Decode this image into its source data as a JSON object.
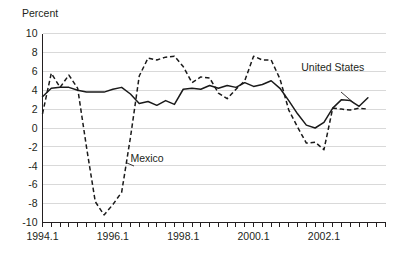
{
  "chart_data": {
    "type": "line",
    "title": "",
    "ylabel": "Percent",
    "xlabel": "",
    "ylim": [
      -10,
      10
    ],
    "ytick_labels": [
      "10",
      "8",
      "6",
      "4",
      "2",
      "0",
      "-2",
      "-4",
      "-6",
      "-8",
      "-10"
    ],
    "ytick_values": [
      10,
      8,
      6,
      4,
      2,
      0,
      -2,
      -4,
      -6,
      -8,
      -10
    ],
    "xtick_labels": [
      "1994.1",
      "1996.1",
      "1998.1",
      "2000.1",
      "2002.1"
    ],
    "xtick_values": [
      1994.1,
      1996.1,
      1998.1,
      2000.1,
      2002.1
    ],
    "xlim": [
      1994.1,
      2003.4
    ],
    "grid": true,
    "legend_position": "inline-annotations",
    "annotations": [
      {
        "text": "United States",
        "x": 2001.6,
        "y": 6.0
      },
      {
        "text": "Mexico",
        "x": 1996.3,
        "y": -3.6
      }
    ],
    "x": [
      1994.1,
      1994.2,
      1994.3,
      1994.4,
      1995.1,
      1995.2,
      1995.3,
      1995.4,
      1996.1,
      1996.2,
      1996.3,
      1996.4,
      1997.1,
      1997.2,
      1997.3,
      1997.4,
      1998.1,
      1998.2,
      1998.3,
      1998.4,
      1999.1,
      1999.2,
      1999.3,
      1999.4,
      2000.1,
      2000.2,
      2000.3,
      2000.4,
      2001.1,
      2001.2,
      2001.3,
      2001.4,
      2002.1,
      2002.2,
      2002.3,
      2002.4,
      2003.1,
      2003.2
    ],
    "series": [
      {
        "name": "United States",
        "style": "solid",
        "values": [
          3.3,
          4.2,
          4.3,
          4.3,
          4.0,
          3.8,
          3.8,
          3.8,
          4.1,
          4.3,
          3.6,
          2.6,
          2.8,
          2.4,
          2.9,
          2.5,
          4.1,
          4.2,
          4.1,
          4.5,
          4.2,
          4.5,
          4.3,
          4.8,
          4.4,
          4.6,
          5.0,
          4.2,
          2.9,
          1.5,
          0.3,
          0.0,
          0.6,
          2.1,
          3.0,
          2.9,
          2.3,
          3.2
        ]
      },
      {
        "name": "Mexico",
        "style": "dashed",
        "values": [
          1.5,
          5.8,
          4.3,
          5.6,
          4.2,
          -2.0,
          -7.8,
          -9.2,
          -8.1,
          -6.8,
          -1.0,
          5.5,
          7.4,
          7.2,
          7.5,
          7.6,
          6.5,
          4.8,
          5.4,
          5.3,
          3.7,
          3.1,
          4.1,
          5.0,
          7.6,
          7.2,
          7.2,
          5.2,
          1.9,
          0.1,
          -1.6,
          -1.5,
          -2.3,
          2.1,
          2.0,
          1.9,
          2.1,
          2.0
        ]
      }
    ]
  }
}
